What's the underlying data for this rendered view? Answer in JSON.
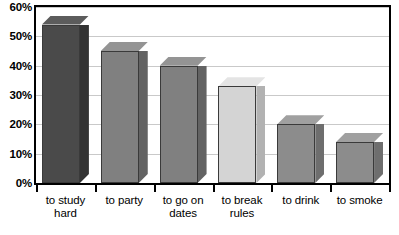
{
  "chart_data": {
    "type": "bar",
    "title": "",
    "subtitle": "",
    "xlabel": "",
    "ylabel": "",
    "categories": [
      "to study hard",
      "to party",
      "to go on dates",
      "to break rules",
      "to drink",
      "to smoke"
    ],
    "category_lines": [
      [
        "to study",
        "hard"
      ],
      [
        "to party"
      ],
      [
        "to go on",
        "dates"
      ],
      [
        "to break",
        "rules"
      ],
      [
        "to drink"
      ],
      [
        "to smoke"
      ]
    ],
    "values": [
      54,
      45,
      40,
      33,
      20,
      14
    ],
    "ylim": [
      0,
      60
    ],
    "ytick_values": [
      0,
      10,
      20,
      30,
      40,
      50,
      60
    ],
    "ytick_labels": [
      "0%",
      "10%",
      "20%",
      "30%",
      "40%",
      "50%",
      "60%"
    ],
    "grid": true,
    "legend": null,
    "style": "3d-columns-grayscale",
    "bar_colors": [
      "#4a4a4a",
      "#808080",
      "#808080",
      "#d4d4d4",
      "#8c8c8c",
      "#8c8c8c"
    ],
    "bar_side_colors": [
      "#333333",
      "#636363",
      "#636363",
      "#b2b2b2",
      "#6e6e6e",
      "#6e6e6e"
    ],
    "bar_top_colors": [
      "#5c5c5c",
      "#949494",
      "#949494",
      "#e4e4e4",
      "#a0a0a0",
      "#a0a0a0"
    ],
    "highlight_index": 3,
    "axis_color": "#000000",
    "gridline_color": "#c9c9c9",
    "background_color": "#ffffff"
  }
}
